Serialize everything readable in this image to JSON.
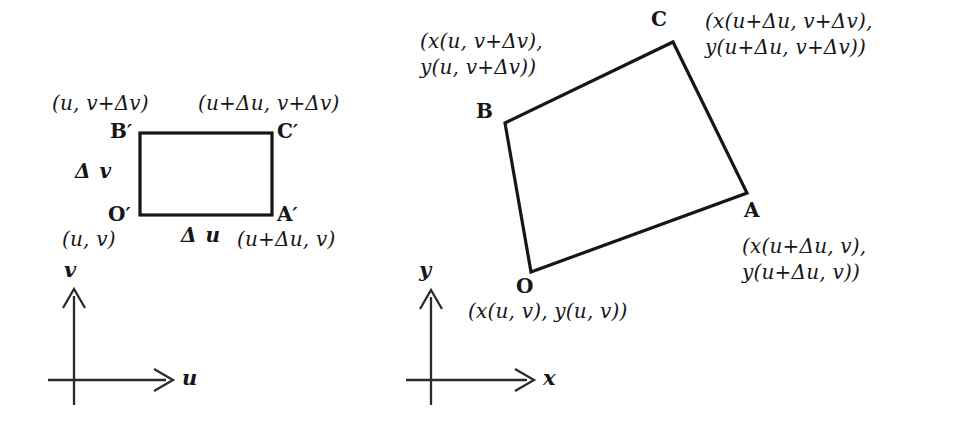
{
  "figure": {
    "ink_color": "#161616",
    "axis_color": "#2b2b2b",
    "background": "#ffffff"
  },
  "left_panel": {
    "name": "uv-plane",
    "axes": {
      "x_label": "u",
      "y_label": "v"
    },
    "rectangle": {
      "vertices": [
        {
          "id": "O'",
          "label": "O",
          "prime": "′",
          "coord_text": "(u,  v)"
        },
        {
          "id": "A'",
          "label": "A",
          "prime": "′",
          "coord_text": "(u+Δu,  v)"
        },
        {
          "id": "C'",
          "label": "C",
          "prime": "′",
          "coord_text": "(u+Δu,  v+Δv)"
        },
        {
          "id": "B'",
          "label": "B",
          "prime": "′",
          "coord_text": "(u,  v+Δv)"
        }
      ],
      "side_labels": {
        "bottom": "Δ u",
        "left": "Δ v"
      }
    }
  },
  "right_panel": {
    "name": "xy-plane",
    "axes": {
      "x_label": "x",
      "y_label": "y"
    },
    "quadrilateral": {
      "vertices": [
        {
          "id": "O",
          "label": "O",
          "coord_line1": "(x(u,  v),  y(u,  v))",
          "coord_line2": ""
        },
        {
          "id": "A",
          "label": "A",
          "coord_line1": "(x(u+Δu,  v),",
          "coord_line2": "y(u+Δu,  v))"
        },
        {
          "id": "C",
          "label": "C",
          "coord_line1": "(x(u+Δu,  v+Δv),",
          "coord_line2": "y(u+Δu,  v+Δv))"
        },
        {
          "id": "B",
          "label": "B",
          "coord_line1": "(x(u,  v+Δv),",
          "coord_line2": "y(u,  v+Δv))"
        }
      ]
    }
  }
}
